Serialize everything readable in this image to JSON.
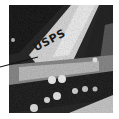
{
  "image": {
    "description": "Grayscale aerial photograph with annotation label",
    "tone": "grayscale",
    "colors": {
      "dark": "#1e1e1e",
      "mid": "#6e6e6e",
      "light": "#e6e6e6",
      "background": "#ffffff"
    }
  },
  "annotation": {
    "label": "USPS",
    "leader_line": {
      "from": [
        0,
        67
      ],
      "to": [
        38,
        57
      ],
      "color": "#111111"
    }
  }
}
